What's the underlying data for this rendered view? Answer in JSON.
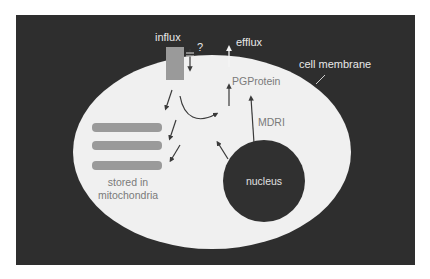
{
  "diagram": {
    "colors": {
      "page_background": "#ffffff",
      "frame_background": "#2e2e2e",
      "cell_fill": "#f0f0f0",
      "organelle_gray": "#9a9a9a",
      "nucleus_fill": "#303030",
      "arrow_dark": "#3a3a3a",
      "label_light": "#e8e8e8",
      "label_gray": "#7a7a7a"
    },
    "labels": {
      "influx": "influx",
      "influx_question": "?",
      "efflux": "efflux",
      "cell_membrane": "cell membrane",
      "pgprotein": "PGProtein",
      "mdri": "MDRI",
      "nucleus": "nucleus",
      "stored_line1": "stored in",
      "stored_line2": "mitochondria"
    },
    "nodes": [
      {
        "id": "influx-channel",
        "label": "influx"
      },
      {
        "id": "efflux-pump",
        "label": "efflux"
      },
      {
        "id": "pgprotein",
        "label": "PGProtein"
      },
      {
        "id": "nucleus",
        "label": "nucleus"
      },
      {
        "id": "mitochondria",
        "label": "stored in mitochondria",
        "count": 3
      },
      {
        "id": "membrane",
        "label": "cell membrane"
      }
    ],
    "edges": [
      {
        "from": "outside",
        "to": "cytoplasm",
        "label": "influx",
        "note": "blocked?"
      },
      {
        "from": "influx-channel",
        "to": "mitochondria"
      },
      {
        "from": "influx-channel",
        "to": "pgprotein",
        "style": "curved"
      },
      {
        "from": "nucleus",
        "to": "pgprotein",
        "label": "MDRI"
      },
      {
        "from": "nucleus",
        "to": "cytoplasm"
      },
      {
        "from": "pgprotein",
        "to": "outside",
        "label": "efflux"
      }
    ]
  }
}
